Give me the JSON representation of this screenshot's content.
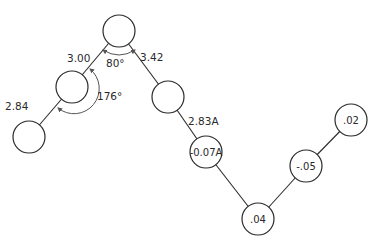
{
  "diagram": {
    "type": "molecular-chain",
    "colors": {
      "stroke": "#2a2a2a",
      "arc": "#555555",
      "background": "#ffffff"
    },
    "atoms": [
      {
        "id": "a1",
        "cx": 29,
        "cy": 137,
        "r": 16,
        "label": ""
      },
      {
        "id": "a2",
        "cx": 72,
        "cy": 87,
        "r": 16,
        "label": ""
      },
      {
        "id": "a3",
        "cx": 119,
        "cy": 31,
        "r": 16,
        "label": ""
      },
      {
        "id": "a4",
        "cx": 168,
        "cy": 97,
        "r": 16,
        "label": ""
      },
      {
        "id": "a5",
        "cx": 206,
        "cy": 152,
        "r": 16,
        "label": "-0.07A"
      },
      {
        "id": "a6",
        "cx": 258,
        "cy": 219,
        "r": 16,
        "label": ".04"
      },
      {
        "id": "a7",
        "cx": 306,
        "cy": 166,
        "r": 16,
        "label": "-.05"
      },
      {
        "id": "a8",
        "cx": 351,
        "cy": 120,
        "r": 16,
        "label": ".02"
      }
    ],
    "bonds": [
      {
        "from": "a1",
        "to": "a2",
        "length_label": "2.84",
        "lx": 5,
        "ly": 110
      },
      {
        "from": "a2",
        "to": "a3",
        "length_label": "3.00",
        "lx": 67,
        "ly": 62
      },
      {
        "from": "a3",
        "to": "a4",
        "length_label": "3.42",
        "lx": 140,
        "ly": 61
      },
      {
        "from": "a4",
        "to": "a5",
        "length_label": "2.83A",
        "lx": 188,
        "ly": 125
      },
      {
        "from": "a5",
        "to": "a6",
        "length_label": "",
        "lx": 0,
        "ly": 0
      },
      {
        "from": "a6",
        "to": "a7",
        "length_label": "",
        "lx": 0,
        "ly": 0
      },
      {
        "from": "a7",
        "to": "a8",
        "length_label": "",
        "lx": 0,
        "ly": 0
      }
    ],
    "angles": [
      {
        "id": "angle-80",
        "label": "80°",
        "lx": 106,
        "ly": 67
      },
      {
        "id": "angle-176",
        "label": "176°",
        "lx": 97,
        "ly": 100
      }
    ]
  }
}
